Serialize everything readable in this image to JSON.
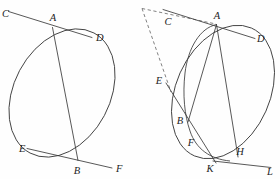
{
  "figure": {
    "background_color": "#fefefe",
    "stroke_color": "#3a3a3a",
    "dashed_stroke_color": "#6a6a6a",
    "label_color": "#1d1d1d"
  },
  "left_figure": {
    "name": "ellipse-with-two-tangents",
    "labels": {
      "C": "C",
      "A": "A",
      "D": "D",
      "E": "E",
      "B": "B",
      "F": "F"
    },
    "points": {
      "A": [
        52,
        27
      ],
      "B": [
        78,
        160
      ],
      "C": [
        8,
        10
      ],
      "D": [
        93,
        37
      ],
      "E": [
        26,
        148
      ],
      "F": [
        113,
        168
      ]
    },
    "ellipse": {
      "center": [
        62,
        93
      ],
      "rx": 48,
      "ry": 68,
      "rotation_deg": 28
    },
    "segments": [
      {
        "name": "tangent-CD-at-A",
        "from": "C",
        "to": "D",
        "through": "A"
      },
      {
        "name": "tangent-EF-at-B",
        "from": "E",
        "to": "F",
        "through": "B"
      },
      {
        "name": "chord-AB",
        "from": "A",
        "to": "B"
      }
    ]
  },
  "right_figure": {
    "name": "ellipse-with-tangents-and-dashed-pole",
    "labels": {
      "C": "C",
      "A": "A",
      "D": "D",
      "E": "E",
      "B": "B",
      "F": "F",
      "K": "K",
      "H": "H",
      "L": "L"
    },
    "points": {
      "A": [
        217,
        24
      ],
      "B": [
        186,
        117
      ],
      "C": [
        172,
        20
      ],
      "D": [
        256,
        38
      ],
      "E": [
        163,
        79
      ],
      "F": [
        196,
        139
      ],
      "K": [
        214,
        165
      ],
      "H": [
        238,
        155
      ],
      "L": [
        271,
        167
      ],
      "apex": [
        142,
        8
      ]
    },
    "ellipse_major": {
      "center": [
        223,
        92
      ],
      "rx": 47,
      "ry": 70,
      "rotation_deg": 24
    },
    "ellipse_minor": {
      "center": [
        205,
        75
      ],
      "rx": 26,
      "ry": 55,
      "rotation_deg": 8
    },
    "segments": [
      {
        "name": "tangent-CD-at-A",
        "from": "C",
        "to": "D",
        "through": "A"
      },
      {
        "name": "tangent-KL-at-H",
        "from": "K",
        "to": "L",
        "through": "H"
      },
      {
        "name": "chord-AH",
        "from": "A",
        "to": "H"
      },
      {
        "name": "chord-AB",
        "from": "A",
        "to": "B"
      },
      {
        "name": "secant-E-to-K",
        "from": "E",
        "to": "K",
        "through": "B,F"
      },
      {
        "name": "dashed-apex-to-A",
        "from": "apex",
        "to": "A",
        "style": "dashed"
      },
      {
        "name": "dashed-apex-to-E",
        "from": "apex",
        "to": "E",
        "style": "dashed"
      }
    ]
  }
}
